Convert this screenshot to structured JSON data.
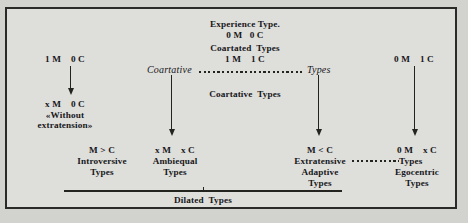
{
  "diagram": {
    "title_lines": {
      "experience_type": "Experience Type.",
      "experience_formula": "0 M   0 C",
      "coartated_label": "Coartated  Types",
      "coartated_formula": "1 M    1 C"
    },
    "axis": {
      "left_italic": "Coartative",
      "right_italic": "Types",
      "center_label": "Coartative  Types"
    },
    "columns": [
      {
        "id": "introversive",
        "top_formula": "1 M    0 C",
        "mid_formula": "x M    0 C",
        "mid_note_line1": "«Without",
        "mid_note_line2": "extratension»",
        "bottom_formula": "M > C",
        "bottom_label_line1": "Introversive",
        "bottom_label_line2": "Types"
      },
      {
        "id": "ambiequal",
        "bottom_formula": "x M    x C",
        "bottom_label_line1": "Ambiequal",
        "bottom_label_line2": "Types"
      },
      {
        "id": "extratensive",
        "bottom_formula": "M < C",
        "bottom_label_line1": "Extratensive",
        "bottom_label_line2": "Adaptive",
        "bottom_label_line3": "Types"
      },
      {
        "id": "egocentric",
        "top_formula": "0 M    1 C",
        "bottom_formula": "0 M    x C",
        "bottom_label_line1": "Types",
        "bottom_label_line2": "Egocentric",
        "bottom_label_line3": "Types"
      }
    ],
    "footer": {
      "dilated_label": "Dilated  Types"
    },
    "colors": {
      "ink": "#17171a",
      "plate": "#dededa",
      "page": "#d2d2ce",
      "border": "#2a2a28"
    }
  }
}
